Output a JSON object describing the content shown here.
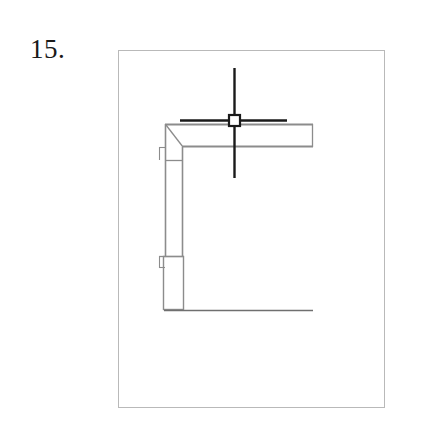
{
  "figure": {
    "label": "15.",
    "caption": ""
  },
  "frame": {
    "x": 118,
    "y": 50,
    "width": 267,
    "height": 358,
    "stroke_color": "#b9b9b9",
    "stroke_width": 1,
    "fill_color": "#ffffff"
  },
  "colors": {
    "paper": "#ffffff",
    "frame_line": "#b9b9b9",
    "wall_line": "#8c8c8c",
    "wall_fill": "#ffffff",
    "cursor_line": "#1a1a1a",
    "thin_line": "#6f6f6f",
    "label_text": "#1a1a1a"
  },
  "drawing": {
    "type": "cad-floor-plan-fragment",
    "description": "L-shaped double-line wall with mitered corner, a door opening on the lower vertical wall, and a thin reference line along the bottom",
    "elements": [
      {
        "name": "horizontal-wall",
        "kind": "double-line-wall",
        "x1": 165,
        "y1": 124,
        "x2": 313,
        "y2": 147,
        "orientation": "horizontal",
        "thickness": 23
      },
      {
        "name": "vertical-wall",
        "kind": "double-line-wall",
        "x1": 165,
        "y1": 124,
        "x2": 183,
        "y2": 310,
        "orientation": "vertical",
        "thickness": 18
      },
      {
        "name": "mitered-corner",
        "kind": "miter-diagonal",
        "x1": 165,
        "y1": 124,
        "x2": 183,
        "y2": 147
      },
      {
        "name": "door-opening",
        "kind": "opening-rectangle",
        "x": 163,
        "y": 256,
        "width": 21,
        "height": 54
      },
      {
        "name": "baseline-reference",
        "kind": "thin-line",
        "x1": 165,
        "y1": 310,
        "x2": 313,
        "y2": 310
      }
    ]
  },
  "cursor": {
    "name": "autocad-crosshair",
    "center_x": 234,
    "center_y": 120,
    "horizontal_start_x": 180,
    "horizontal_end_x": 287,
    "vertical_start_y": 68,
    "vertical_end_y": 178,
    "pick_box_size": 11,
    "line_width": 2,
    "color": "#1a1a1a"
  }
}
